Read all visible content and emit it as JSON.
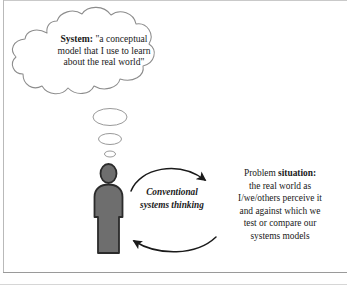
{
  "figure": {
    "background_color": "#ffffff",
    "ink_color": "#1a1a1a",
    "frame_color": "#b9b9b9"
  },
  "thought_bubble": {
    "lead_label": "System:",
    "quote_line1": "\"a conceptual",
    "quote_line2": "model that I use to learn",
    "quote_line3": "about the real world\"",
    "outline_color": "#8c8c8c"
  },
  "thought_trail": {
    "count": 3,
    "outline_color": "#9a9a9a"
  },
  "person": {
    "label": "observer-figure",
    "fill_color": "#6e6e6e",
    "outline_color": "#2b2b2b"
  },
  "cycle": {
    "label_line1": "Conventional",
    "label_line2": "systems thinking",
    "arrow_color": "#1a1a1a",
    "top_arrow_name": "arrow-person-to-problem",
    "bottom_arrow_name": "arrow-problem-to-person"
  },
  "problem_situation": {
    "heading_regular": "Problem ",
    "heading_bold": "situation:",
    "line1": "the real world as",
    "line2": "I/we/others perceive it",
    "line3": "and against which we",
    "line4": "test or compare our",
    "line5": "systems models"
  }
}
